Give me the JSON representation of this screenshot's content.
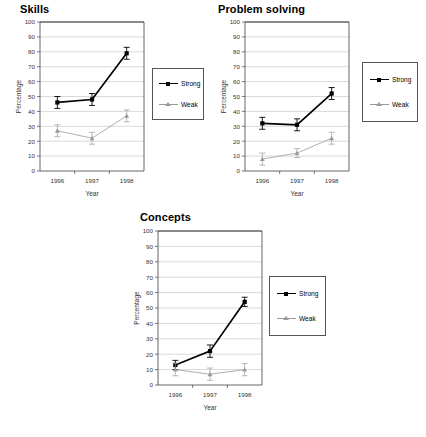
{
  "figure": {
    "background": "#ffffff",
    "series_colors": {
      "strong": "#000000",
      "weak": "#9a9a9a"
    }
  },
  "legend": {
    "strong_label": "Strong",
    "weak_label": "Weak"
  },
  "axes": {
    "ylabel": "Percentage",
    "xlabel": "Year",
    "yticks": [
      "0",
      "10",
      "20",
      "30",
      "40",
      "50",
      "60",
      "70",
      "80",
      "90",
      "100"
    ],
    "xticks": [
      "1996",
      "1997",
      "1998"
    ]
  },
  "chart_data": [
    {
      "type": "line",
      "title": "Skills",
      "categories": [
        "1996",
        "1997",
        "1998"
      ],
      "xlabel": "Year",
      "ylabel": "Percentage",
      "ylim": [
        0,
        100
      ],
      "grid": true,
      "legend_position": "right-outside",
      "series": [
        {
          "name": "Strong",
          "values": [
            46,
            48,
            79
          ],
          "errors": [
            4,
            4,
            4
          ],
          "color": "#000000",
          "marker": "square"
        },
        {
          "name": "Weak",
          "values": [
            27,
            22,
            37
          ],
          "errors": [
            4,
            4,
            4
          ],
          "color": "#9a9a9a",
          "marker": "triangle"
        }
      ]
    },
    {
      "type": "line",
      "title": "Problem solving",
      "categories": [
        "1996",
        "1997",
        "1998"
      ],
      "xlabel": "Year",
      "ylabel": "Percentage",
      "ylim": [
        0,
        100
      ],
      "grid": true,
      "legend_position": "right-outside",
      "series": [
        {
          "name": "Strong",
          "values": [
            32,
            31,
            52
          ],
          "errors": [
            4,
            4,
            4
          ],
          "color": "#000000",
          "marker": "square"
        },
        {
          "name": "Weak",
          "values": [
            8,
            12,
            22
          ],
          "errors": [
            4,
            3,
            4
          ],
          "color": "#9a9a9a",
          "marker": "triangle"
        }
      ]
    },
    {
      "type": "line",
      "title": "Concepts",
      "categories": [
        "1996",
        "1997",
        "1998"
      ],
      "xlabel": "Year",
      "ylabel": "Percentage",
      "ylim": [
        0,
        100
      ],
      "grid": true,
      "legend_position": "right-outside",
      "series": [
        {
          "name": "Strong",
          "values": [
            13,
            22,
            54
          ],
          "errors": [
            3,
            4,
            3
          ],
          "color": "#000000",
          "marker": "square"
        },
        {
          "name": "Weak",
          "values": [
            10,
            7,
            10
          ],
          "errors": [
            4,
            4,
            4
          ],
          "color": "#9a9a9a",
          "marker": "triangle"
        }
      ]
    }
  ]
}
